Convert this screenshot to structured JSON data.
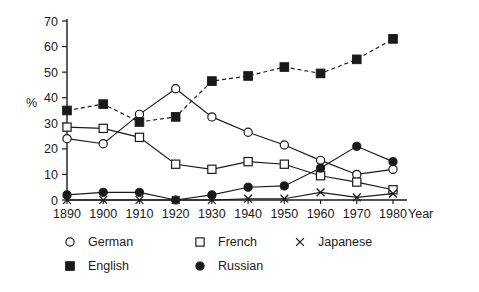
{
  "chart_data": {
    "type": "line",
    "title": "",
    "subtitle": "",
    "xlabel": "Year",
    "ylabel": "%",
    "x": [
      1890,
      1900,
      1910,
      1920,
      1930,
      1940,
      1950,
      1960,
      1970,
      1980
    ],
    "xtick_labels": [
      "1890",
      "1900",
      "1910",
      "1920",
      "1930",
      "1940",
      "1950",
      "1960",
      "1970",
      "1980"
    ],
    "ytick_labels": [
      "0",
      "10",
      "20",
      "30",
      "40",
      "50",
      "60",
      "70"
    ],
    "yticks": [
      0,
      10,
      20,
      30,
      40,
      50,
      60,
      70
    ],
    "ylim": [
      0,
      70
    ],
    "xlim": [
      1890,
      1980
    ],
    "grid": false,
    "legend_position": "bottom-left",
    "series": [
      {
        "name": "German",
        "marker": "open-circle",
        "linestyle": "solid",
        "color": "#1a1a1a",
        "values": [
          24,
          22,
          33.5,
          43.5,
          32.5,
          26.5,
          21.5,
          15.5,
          10,
          12
        ]
      },
      {
        "name": "French",
        "marker": "open-square",
        "linestyle": "solid",
        "color": "#1a1a1a",
        "values": [
          28.5,
          28,
          24.5,
          14,
          12,
          15,
          14,
          9.5,
          7,
          4
        ]
      },
      {
        "name": "Japanese",
        "marker": "cross",
        "linestyle": "solid",
        "color": "#1a1a1a",
        "values": [
          0,
          0,
          0,
          0,
          0,
          0.5,
          0.5,
          3,
          1,
          2.5
        ]
      },
      {
        "name": "English",
        "marker": "filled-square",
        "linestyle": "dashed",
        "color": "#1a1a1a",
        "values": [
          35,
          37.5,
          30.5,
          32.5,
          46.5,
          48.5,
          52,
          49.5,
          55,
          63
        ]
      },
      {
        "name": "Russian",
        "marker": "filled-circle",
        "linestyle": "solid",
        "color": "#1a1a1a",
        "values": [
          2,
          3,
          3,
          0,
          2,
          5,
          5.5,
          12.5,
          21,
          15
        ]
      }
    ]
  },
  "legend": {
    "entries": [
      {
        "label": "German",
        "marker": "open-circle"
      },
      {
        "label": "French",
        "marker": "open-square"
      },
      {
        "label": "Japanese",
        "marker": "cross"
      },
      {
        "label": "English",
        "marker": "filled-square"
      },
      {
        "label": "Russian",
        "marker": "filled-circle"
      }
    ]
  },
  "axes": {
    "y_axis_title": "%",
    "x_axis_title": "Year"
  }
}
